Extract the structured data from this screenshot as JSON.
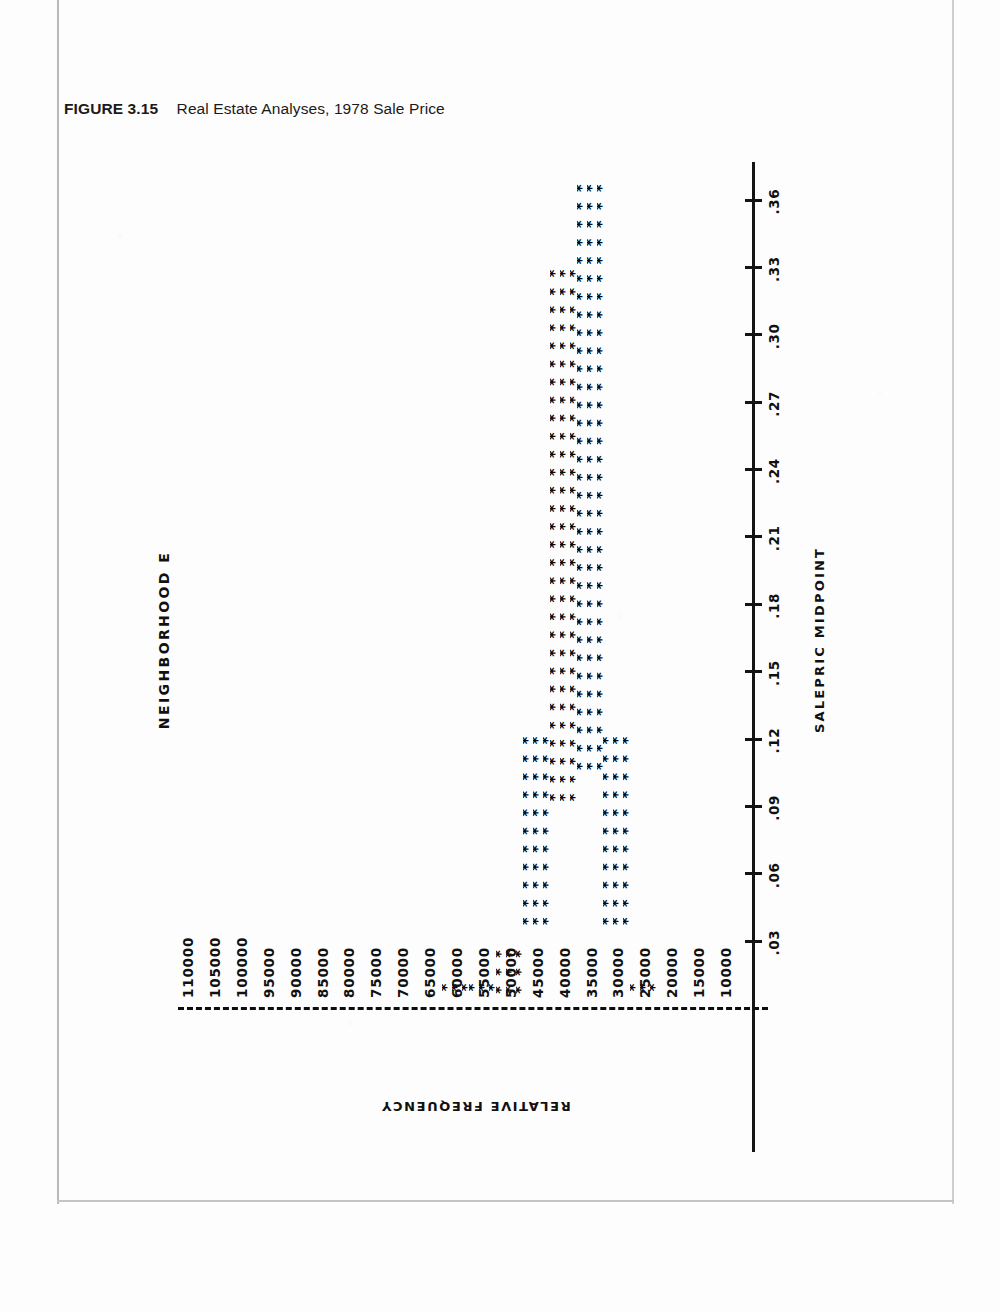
{
  "caption": {
    "label": "FIGURE",
    "number": "3.15",
    "text": "Real Estate Analyses, 1978 Sale Price"
  },
  "chart_data": {
    "type": "bar",
    "orientation": "horizontal",
    "title": "NEIGHBORHOOD E",
    "xlabel": "SALEPRIC MIDPOINT",
    "ylabel": "RELATIVE FREQUENCY",
    "glyph": "*",
    "grid": false,
    "legend": null,
    "xlim": [
      7500,
      112500
    ],
    "ylim": [
      0,
      0.375
    ],
    "ytick_labels": [
      ".36",
      ".33",
      ".30",
      ".27",
      ".24",
      ".21",
      ".18",
      ".15",
      ".12",
      ".09",
      ".06",
      ".03"
    ],
    "ytick_values": [
      0.36,
      0.33,
      0.3,
      0.27,
      0.24,
      0.21,
      0.18,
      0.15,
      0.12,
      0.09,
      0.06,
      0.03
    ],
    "categories": [
      "10000",
      "15000",
      "20000",
      "25000",
      "30000",
      "35000",
      "40000",
      "45000",
      "50000",
      "55000",
      "60000",
      "65000",
      "70000",
      "75000",
      "80000",
      "85000",
      "90000",
      "95000",
      "100000",
      "105000",
      "110000"
    ],
    "values": [
      0,
      0,
      0,
      0.012,
      0.122,
      0.368,
      0.33,
      0.122,
      0.027,
      0.012,
      0.012,
      0,
      0,
      0,
      0,
      0,
      0,
      0,
      0,
      0,
      0
    ],
    "bar_star_counts": [
      0,
      0,
      0,
      3,
      33,
      99,
      90,
      33,
      9,
      3,
      3,
      0,
      0,
      0,
      0,
      0,
      0,
      0,
      0,
      0,
      0
    ],
    "bar_rows": 3,
    "axis_color": "#0d0d0d",
    "bar_color": "#0a0a0a",
    "background_color": "#ffffff"
  }
}
